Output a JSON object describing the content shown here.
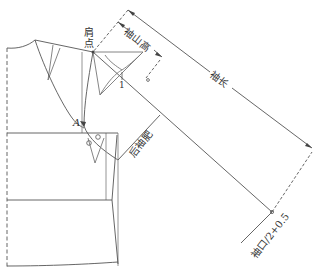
{
  "diagram": {
    "type": "sleeve-pattern-drafting",
    "labels": {
      "shoulder_point_line1": "肩",
      "shoulder_point_line2": "点",
      "sleeve_cap_height": "袖山高",
      "sleeve_length": "袖长",
      "back_sleeve_width": "后袖肥",
      "cuff": "袖口/2+0.5",
      "point_a": "A",
      "mark_1": "1"
    },
    "colors": {
      "line": "#555555",
      "light_line": "#888888",
      "background": "#ffffff"
    }
  }
}
